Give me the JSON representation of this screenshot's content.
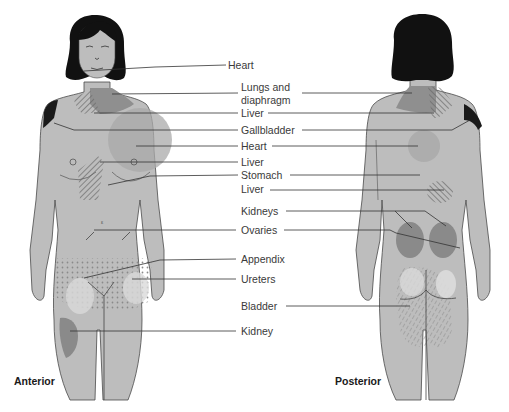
{
  "colors": {
    "background": "#ffffff",
    "skin": "#bdbdbd",
    "outline": "#4a4a4a",
    "hair": "#111111",
    "dark_region": "#8a8a8a",
    "medium_region": "#a9a9a9",
    "light_region": "#d9d9d9",
    "black_region": "#1a1a1a",
    "leader_line": "#333333",
    "label_text": "#3a3a3a"
  },
  "views": {
    "anterior": {
      "label": "Anterior"
    },
    "posterior": {
      "label": "Posterior"
    }
  },
  "labels": [
    {
      "id": "heart-1",
      "text": "Heart",
      "x": 228,
      "y": 32
    },
    {
      "id": "lungs",
      "text": "Lungs and",
      "x": 241,
      "y": 55
    },
    {
      "id": "lungs-2",
      "text": "diaphragm",
      "x": 241,
      "y": 68
    },
    {
      "id": "liver-1",
      "text": "Liver",
      "x": 241,
      "y": 80
    },
    {
      "id": "gallbladder",
      "text": "Gallbladder",
      "x": 241,
      "y": 125
    },
    {
      "id": "heart-2",
      "text": "Heart",
      "x": 241,
      "y": 140
    },
    {
      "id": "liver-2",
      "text": "Liver",
      "x": 241,
      "y": 157
    },
    {
      "id": "stomach",
      "text": "Stomach",
      "x": 241,
      "y": 170
    },
    {
      "id": "liver-3",
      "text": "Liver",
      "x": 241,
      "y": 183
    },
    {
      "id": "kidneys",
      "text": "Kidneys",
      "x": 241,
      "y": 205
    },
    {
      "id": "ovaries",
      "text": "Ovaries",
      "x": 241,
      "y": 224
    },
    {
      "id": "appendix",
      "text": "Appendix",
      "x": 241,
      "y": 253
    },
    {
      "id": "ureters",
      "text": "Ureters",
      "x": 241,
      "y": 273
    },
    {
      "id": "bladder",
      "text": "Bladder",
      "x": 241,
      "y": 300
    },
    {
      "id": "kidney",
      "text": "Kidney",
      "x": 241,
      "y": 325
    }
  ]
}
